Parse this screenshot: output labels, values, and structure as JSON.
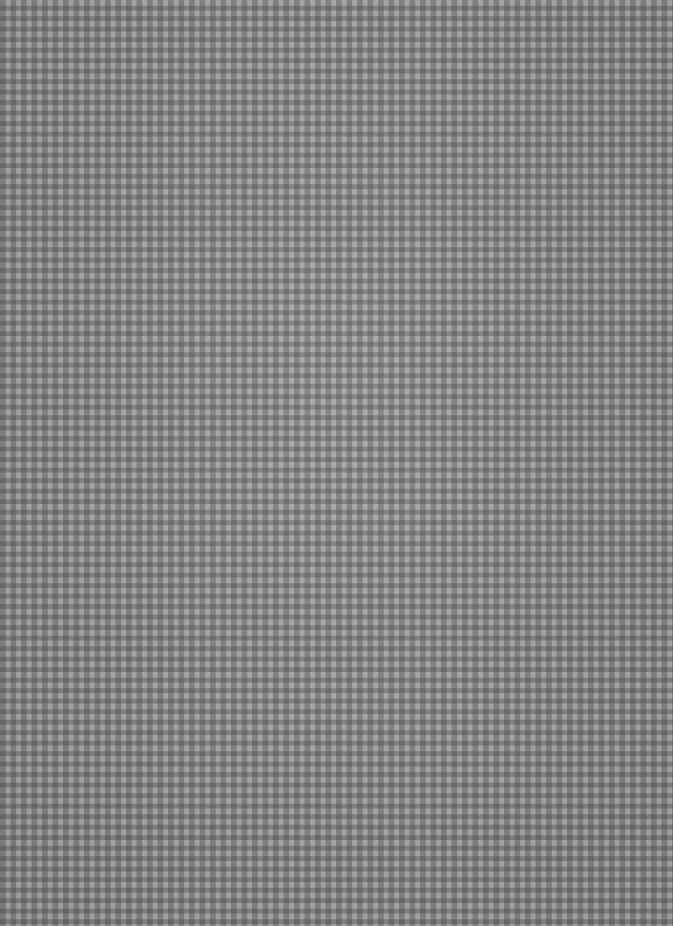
{
  "image": {
    "subject": "gingham-check-fabric-texture",
    "colors": {
      "light": "#a9a9a9",
      "mid": "#8a8a8a",
      "dark": "#6a6a6a"
    },
    "check_period_px": 10.5
  }
}
